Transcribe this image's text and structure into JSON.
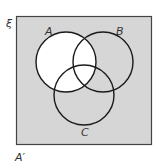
{
  "diagram": {
    "type": "venn",
    "universal_label": "ξ",
    "sets": [
      {
        "label": "A",
        "cx": 66,
        "cy": 62,
        "r": 30
      },
      {
        "label": "B",
        "cx": 103,
        "cy": 62,
        "r": 30
      },
      {
        "label": "C",
        "cx": 84,
        "cy": 95,
        "r": 30
      }
    ],
    "shaded_region": "A'",
    "caption": "A′",
    "colors": {
      "shade": "#d6d6d6",
      "unshaded": "#ffffff",
      "stroke": "#1a1a1a"
    }
  }
}
